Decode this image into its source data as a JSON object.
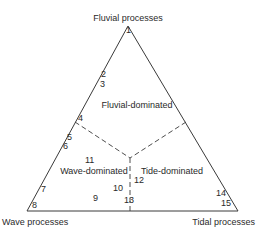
{
  "vertices": {
    "top": "Fluvial processes",
    "left": "Wave processes",
    "right": "Tidal processes"
  },
  "regions": {
    "fluvial": "Fluvial-dominated",
    "wave": "Wave-dominated",
    "tide": "Tide-dominated"
  },
  "points": [
    {
      "id": "1",
      "x": 126,
      "y": 33
    },
    {
      "id": "2",
      "x": 101,
      "y": 77
    },
    {
      "id": "3",
      "x": 100,
      "y": 87
    },
    {
      "id": "4",
      "x": 78,
      "y": 121
    },
    {
      "id": "5",
      "x": 67,
      "y": 140
    },
    {
      "id": "6",
      "x": 63,
      "y": 149
    },
    {
      "id": "7",
      "x": 41,
      "y": 192
    },
    {
      "id": "8",
      "x": 32,
      "y": 208
    },
    {
      "id": "9",
      "x": 93,
      "y": 201
    },
    {
      "id": "10",
      "x": 113,
      "y": 191
    },
    {
      "id": "11",
      "x": 85,
      "y": 163
    },
    {
      "id": "12",
      "x": 134,
      "y": 183
    },
    {
      "id": "13",
      "x": 124,
      "y": 203
    },
    {
      "id": "14",
      "x": 216,
      "y": 196
    },
    {
      "id": "15",
      "x": 221,
      "y": 206
    }
  ]
}
